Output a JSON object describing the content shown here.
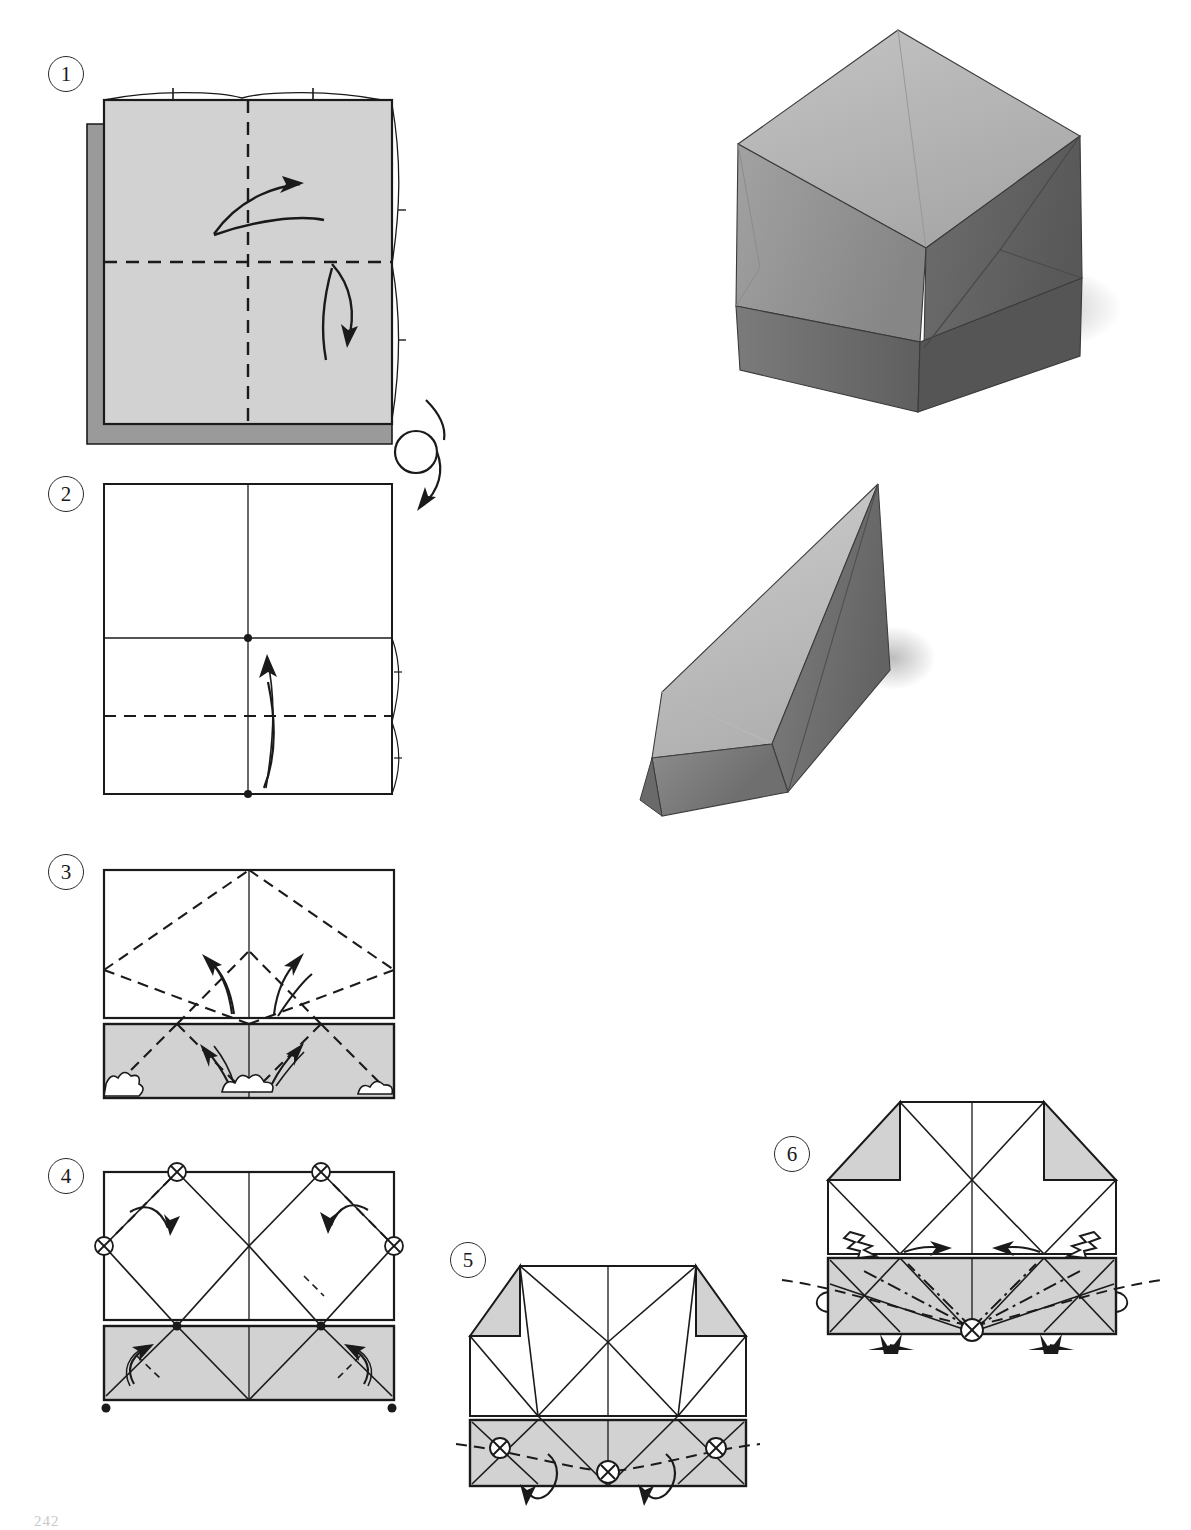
{
  "document": {
    "type": "origami-instruction-page",
    "page_folio": "242",
    "background_color": "#ffffff",
    "ink_color": "#1a1a1a",
    "paper_front_color": "#d2d2d2",
    "paper_shadow_color": "#9a9a9a",
    "paper_back_color": "#ffffff"
  },
  "steps": [
    {
      "id": "step-1",
      "number": "1",
      "caption": "",
      "shape": "square",
      "face": "colored-side-up",
      "fold_lines": [
        {
          "kind": "valley-dashed",
          "orientation": "vertical",
          "position": "center"
        },
        {
          "kind": "valley-dashed",
          "orientation": "horizontal",
          "position": "center"
        }
      ],
      "arrows": [
        "fold-and-unfold-right",
        "fold-and-unfold-down"
      ],
      "symbols": []
    },
    {
      "id": "step-2",
      "number": "2",
      "caption": "",
      "shape": "square",
      "face": "white-side-up",
      "fold_lines": [
        {
          "kind": "crease-solid",
          "orientation": "vertical",
          "position": "center"
        },
        {
          "kind": "crease-solid",
          "orientation": "horizontal",
          "position": "center"
        },
        {
          "kind": "valley-dashed",
          "orientation": "horizontal",
          "position": "lower-quarter"
        }
      ],
      "arrows": [
        "fold-up"
      ],
      "symbols": [
        "turn-over-loop-arrow",
        "reference-dot-center",
        "reference-dot-bottom"
      ]
    },
    {
      "id": "step-3",
      "number": "3",
      "caption": "",
      "shape": "rectangle-with-folded-band",
      "face": "white-with-gray-band",
      "fold_lines": [
        {
          "kind": "crease-solid",
          "orientation": "vertical",
          "position": "center"
        },
        {
          "kind": "valley-dashed",
          "orientation": "diagonal",
          "position": "x-pattern-upper"
        },
        {
          "kind": "valley-dashed",
          "orientation": "diagonal",
          "position": "x-pattern-band"
        }
      ],
      "arrows": [
        "crease-up-left",
        "crease-up-right",
        "crease-down-left",
        "crease-down-right"
      ],
      "symbols": [
        "burst-mark-left",
        "burst-mark-center",
        "burst-mark-right"
      ]
    },
    {
      "id": "step-4",
      "number": "4",
      "caption": "",
      "shape": "rectangle-with-folded-band",
      "face": "white-with-gray-band",
      "fold_lines": [
        {
          "kind": "crease-solid",
          "orientation": "vertical",
          "position": "center"
        },
        {
          "kind": "crease-solid",
          "orientation": "diagonal",
          "position": "large-x-network"
        },
        {
          "kind": "valley-dashed",
          "orientation": "diagonal",
          "position": "corner-tucks"
        }
      ],
      "arrows": [
        "fold-corner-down-left",
        "fold-corner-down-right",
        "fold-up-left",
        "fold-up-right"
      ],
      "symbols": [
        "crossed-circle-top-left",
        "crossed-circle-top-right",
        "crossed-circle-mid-left",
        "crossed-circle-mid-right",
        "dot-bottom-left",
        "dot-bottom-right"
      ]
    },
    {
      "id": "step-5",
      "number": "5",
      "caption": "",
      "shape": "notched-rectangle",
      "face": "white-with-gray-corners-and-band",
      "fold_lines": [
        {
          "kind": "crease-solid",
          "orientation": "vertical",
          "position": "center"
        },
        {
          "kind": "crease-solid",
          "orientation": "diagonal",
          "position": "x-network"
        },
        {
          "kind": "valley-dashed",
          "orientation": "shallow-v",
          "position": "band"
        }
      ],
      "arrows": [
        "roll-down-left",
        "roll-down-right"
      ],
      "symbols": [
        "crossed-circle-left",
        "crossed-circle-center",
        "crossed-circle-right"
      ]
    },
    {
      "id": "step-6",
      "number": "6",
      "caption": "",
      "shape": "notched-rectangle",
      "face": "white-with-gray-corners-and-band",
      "fold_lines": [
        {
          "kind": "crease-solid",
          "orientation": "vertical",
          "position": "center"
        },
        {
          "kind": "crease-solid",
          "orientation": "diagonal",
          "position": "x-network"
        },
        {
          "kind": "mountain-dash-dot",
          "orientation": "fan",
          "position": "band"
        },
        {
          "kind": "valley-dashed",
          "orientation": "shallow-v",
          "position": "band-wide"
        }
      ],
      "arrows": [
        "push-in-left",
        "push-in-right",
        "pull-right",
        "pull-left"
      ],
      "symbols": [
        "lightning-push-left",
        "lightning-push-right",
        "crossed-circle-center",
        "sink-mark-left",
        "sink-mark-right",
        "loop-tab-left",
        "loop-tab-right"
      ]
    }
  ],
  "photographs": [
    {
      "id": "photo-cube",
      "subject": "finished-origami-cube",
      "description": "Completed folded paper cube viewed from an upper corner",
      "top_face_tone": "#b6b6b6",
      "left_face_tone": "#8f8f8f",
      "right_face_tone": "#6a6a6a",
      "shadow_tone": "#d6d6d6"
    },
    {
      "id": "photo-wedge",
      "subject": "finished-origami-wedge",
      "description": "Completed folded paper triangular wedge resting on a flat surface",
      "top_face_tone": "#c0c0c0",
      "side_face_tone": "#7c7c7c",
      "front_face_tone": "#8e8e8e",
      "shadow_tone": "#d9d9d9"
    }
  ]
}
